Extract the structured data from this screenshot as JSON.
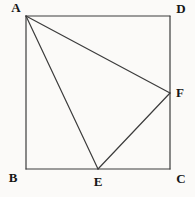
{
  "figure": {
    "width": 195,
    "height": 197,
    "background": "#fbfaf8",
    "line_color": "#3c3c3c",
    "label_color": "#161616",
    "points": {
      "A": {
        "label": "A",
        "x": 26,
        "y": 16,
        "lx": 16,
        "ly": 7
      },
      "B": {
        "label": "B",
        "x": 26,
        "y": 169,
        "lx": 13,
        "ly": 177
      },
      "C": {
        "label": "C",
        "x": 170,
        "y": 169,
        "lx": 181,
        "ly": 178
      },
      "D": {
        "label": "D",
        "x": 170,
        "y": 16,
        "lx": 181,
        "ly": 8
      },
      "E": {
        "label": "E",
        "x": 98,
        "y": 169,
        "lx": 98,
        "ly": 181
      },
      "F": {
        "label": "F",
        "x": 170,
        "y": 93,
        "lx": 180,
        "ly": 92
      }
    },
    "edges": [
      {
        "from": "A",
        "to": "D",
        "part": "square-side-AD"
      },
      {
        "from": "D",
        "to": "C",
        "part": "square-side-DC"
      },
      {
        "from": "C",
        "to": "B",
        "part": "square-side-CB"
      },
      {
        "from": "B",
        "to": "A",
        "part": "square-side-BA"
      },
      {
        "from": "A",
        "to": "E",
        "part": "segment-AE"
      },
      {
        "from": "A",
        "to": "F",
        "part": "segment-AF"
      },
      {
        "from": "E",
        "to": "F",
        "part": "segment-EF"
      }
    ]
  }
}
